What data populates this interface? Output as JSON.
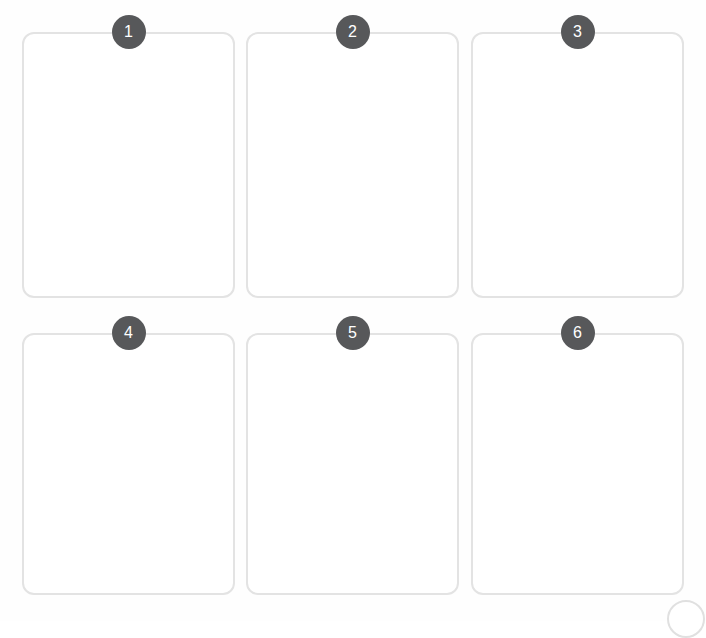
{
  "page": {
    "background_color": "#fefefe"
  },
  "style": {
    "card_border_color": "#e3e3e3",
    "card_fill_color": "#ffffff",
    "badge_color": "#57585a",
    "badge_text_color": "#ffffff",
    "corner_button_border_color": "#e0e0e0"
  },
  "grid": {
    "columns": 3,
    "rows": 2,
    "cards": [
      {
        "badge": "1",
        "name": "card-1",
        "content": ""
      },
      {
        "badge": "2",
        "name": "card-2",
        "content": ""
      },
      {
        "badge": "3",
        "name": "card-3",
        "content": ""
      },
      {
        "badge": "4",
        "name": "card-4",
        "content": ""
      },
      {
        "badge": "5",
        "name": "card-5",
        "content": ""
      },
      {
        "badge": "6",
        "name": "card-6",
        "content": ""
      }
    ]
  },
  "corner_control": {
    "icon": "circle-outline-icon",
    "glyph": ""
  }
}
